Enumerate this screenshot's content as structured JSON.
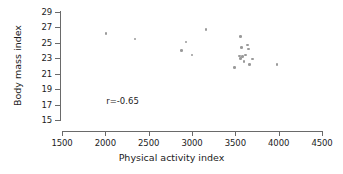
{
  "chart_data": {
    "type": "scatter",
    "title": "",
    "xlabel": "Physical activity index",
    "ylabel": "Body mass index",
    "xlim": [
      1500,
      4500
    ],
    "ylim": [
      15,
      29
    ],
    "xticks": [
      1500,
      2000,
      2500,
      3000,
      3500,
      4000,
      4500
    ],
    "yticks": [
      15,
      17,
      19,
      21,
      23,
      25,
      27,
      29
    ],
    "grid": false,
    "legend": null,
    "annotations": [
      {
        "text": "r=-0.65",
        "x": 2010,
        "y": 17.5
      }
    ],
    "marker_color": "#9a9a9a",
    "axis_color": "#6a6a6a",
    "points": [
      {
        "x": 2010,
        "y": 26.2
      },
      {
        "x": 2340,
        "y": 25.5
      },
      {
        "x": 2880,
        "y": 24.0
      },
      {
        "x": 2930,
        "y": 25.1
      },
      {
        "x": 3000,
        "y": 23.4
      },
      {
        "x": 3160,
        "y": 26.7
      },
      {
        "x": 3490,
        "y": 21.8
      },
      {
        "x": 3560,
        "y": 25.8
      },
      {
        "x": 3570,
        "y": 24.4
      },
      {
        "x": 3545,
        "y": 23.3
      },
      {
        "x": 3560,
        "y": 23.0
      },
      {
        "x": 3585,
        "y": 23.2
      },
      {
        "x": 3600,
        "y": 22.6
      },
      {
        "x": 3620,
        "y": 23.4
      },
      {
        "x": 3640,
        "y": 24.7
      },
      {
        "x": 3655,
        "y": 24.2
      },
      {
        "x": 3665,
        "y": 22.2
      },
      {
        "x": 3700,
        "y": 22.9
      },
      {
        "x": 3980,
        "y": 22.2
      }
    ]
  }
}
